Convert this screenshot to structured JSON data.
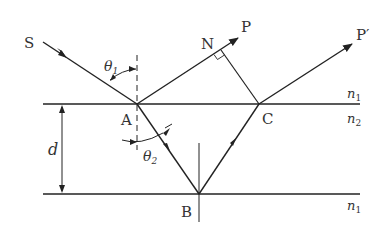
{
  "diagram": {
    "type": "thin-film interference ray diagram",
    "labels": {
      "source": "S",
      "point_a": "A",
      "point_b": "B",
      "point_c": "C",
      "point_n": "N",
      "ray_p": "P",
      "ray_p_prime": "P′",
      "theta1": "θ",
      "theta1_sub": "1",
      "theta2": "θ",
      "theta2_sub": "2",
      "thickness": "d",
      "n_top": "n",
      "n_top_sub": "1",
      "n_film": "n",
      "n_film_sub": "2",
      "n_bottom": "n",
      "n_bottom_sub": "1"
    },
    "colors": {
      "line": "#222222",
      "text": "#333333"
    }
  }
}
